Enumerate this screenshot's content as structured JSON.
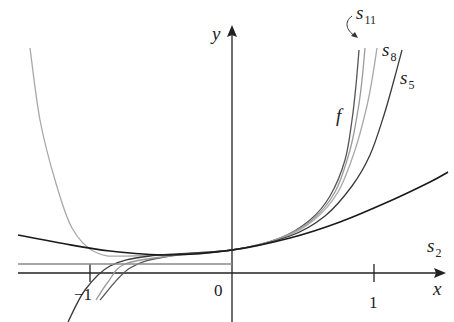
{
  "chart_data": {
    "type": "line",
    "title": "",
    "xlabel": "x",
    "ylabel": "y",
    "x_ticks": [
      {
        "value": -1,
        "label": "−1"
      },
      {
        "value": 0,
        "label": "0"
      },
      {
        "value": 1,
        "label": "1"
      }
    ],
    "grid": false,
    "legend": "inline labels",
    "series": [
      {
        "name": "f",
        "sub": "",
        "color": "#555555",
        "width": 1.3,
        "points": [
          [
            100,
            300
          ],
          [
            130,
            268
          ],
          [
            170,
            256
          ],
          [
            232,
            250
          ],
          [
            280,
            238
          ],
          [
            310,
            220
          ],
          [
            330,
            196
          ],
          [
            345,
            160
          ],
          [
            352,
            120
          ],
          [
            356,
            85
          ],
          [
            359,
            50
          ]
        ]
      },
      {
        "name": "s",
        "sub": "11",
        "color": "#9a9a9a",
        "width": 1.3,
        "points": [
          [
            96,
            300
          ],
          [
            108,
            282
          ],
          [
            125,
            264
          ],
          [
            170,
            256
          ],
          [
            232,
            250
          ],
          [
            280,
            238
          ],
          [
            312,
            220
          ],
          [
            335,
            192
          ],
          [
            350,
            150
          ],
          [
            358,
            110
          ],
          [
            362,
            80
          ],
          [
            365,
            48
          ]
        ]
      },
      {
        "name": "s",
        "sub": "8",
        "color": "#a8a8a8",
        "width": 1.3,
        "points": [
          [
            30,
            48
          ],
          [
            40,
            120
          ],
          [
            55,
            180
          ],
          [
            72,
            228
          ],
          [
            95,
            252
          ],
          [
            130,
            256
          ],
          [
            232,
            250
          ],
          [
            282,
            238
          ],
          [
            314,
            220
          ],
          [
            338,
            192
          ],
          [
            355,
            150
          ],
          [
            366,
            110
          ],
          [
            372,
            80
          ],
          [
            377,
            48
          ]
        ]
      },
      {
        "name": "s",
        "sub": "5",
        "color": "#3a3a3a",
        "width": 1.3,
        "points": [
          [
            68,
            322
          ],
          [
            85,
            290
          ],
          [
            110,
            266
          ],
          [
            150,
            256
          ],
          [
            232,
            250
          ],
          [
            290,
            236
          ],
          [
            325,
            216
          ],
          [
            352,
            186
          ],
          [
            370,
            155
          ],
          [
            384,
            115
          ],
          [
            394,
            80
          ],
          [
            402,
            50
          ]
        ]
      },
      {
        "name": "s",
        "sub": "2",
        "color": "#1a1a1a",
        "width": 1.6,
        "points": [
          [
            18,
            235
          ],
          [
            60,
            243
          ],
          [
            110,
            251
          ],
          [
            170,
            255
          ],
          [
            232,
            250
          ],
          [
            290,
            238
          ],
          [
            340,
            222
          ],
          [
            390,
            201
          ],
          [
            430,
            182
          ],
          [
            448,
            172
          ]
        ]
      },
      {
        "name": "s",
        "sub": "0",
        "color": "#8a8a8a",
        "width": 1.3,
        "points": [
          [
            18,
            264
          ],
          [
            232,
            264
          ]
        ]
      }
    ],
    "labels": {
      "f": "f",
      "s11": {
        "base": "s",
        "sub": "11"
      },
      "s8": {
        "base": "s",
        "sub": "8"
      },
      "s5": {
        "base": "s",
        "sub": "5"
      },
      "s2": {
        "base": "s",
        "sub": "2"
      },
      "x_axis": "x",
      "y_axis": "y",
      "tick_neg1": "−1",
      "tick_0": "0",
      "tick_1": "1"
    }
  }
}
